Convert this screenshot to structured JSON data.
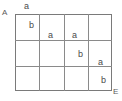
{
  "diagram": {
    "type": "grid-diagram",
    "corner_labels": {
      "top_left": "A",
      "bottom_right": "E"
    },
    "grid": {
      "columns": 4,
      "rows": 3,
      "line_color": "#8a8a8a",
      "border_color": "#7a7a7a"
    },
    "marks": [
      {
        "text": "a",
        "position": "above-top-edge-col1"
      },
      {
        "text": "b",
        "position": "row1-col1"
      },
      {
        "text": "a",
        "position": "row1-col2"
      },
      {
        "text": "a",
        "position": "row1-col3"
      },
      {
        "text": "b",
        "position": "row2-col3"
      },
      {
        "text": "a",
        "position": "row2-col4"
      },
      {
        "text": "b",
        "position": "row3-col4"
      }
    ]
  }
}
